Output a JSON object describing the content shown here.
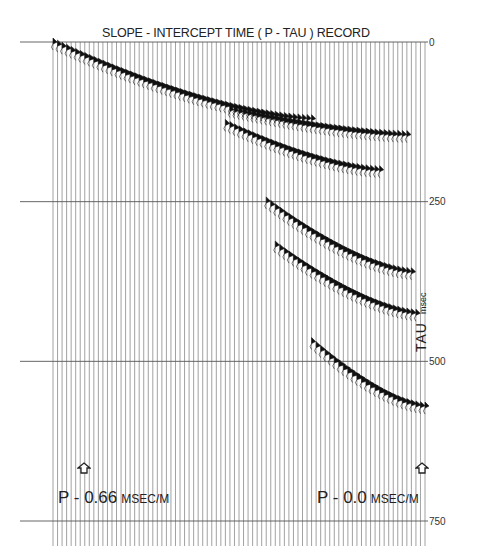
{
  "chart_data": {
    "type": "seismic-wiggle",
    "title": "SLOPE - INTERCEPT TIME ( P - TAU ) RECORD",
    "xlabel": "P (ray parameter)",
    "ylabel": "TAU",
    "ylabel_unit": "msec",
    "yticks": [
      0,
      250,
      500,
      750
    ],
    "ylim": [
      0,
      800
    ],
    "y_inverted": true,
    "trace_count": 83,
    "x_range_label": {
      "left": "P - 0.66 MSEC/M",
      "right": "P - 0.0 MSEC/M"
    },
    "events": [
      {
        "name": "event-1",
        "p_start": 0.66,
        "tau_start_ms": 0,
        "p_end": 0.2,
        "tau_end_ms": 120
      },
      {
        "name": "event-2",
        "p_start": 0.35,
        "tau_start_ms": 105,
        "p_end": 0.03,
        "tau_end_ms": 145
      },
      {
        "name": "event-3",
        "p_start": 0.36,
        "tau_start_ms": 125,
        "p_end": 0.08,
        "tau_end_ms": 200
      },
      {
        "name": "event-4",
        "p_start": 0.28,
        "tau_start_ms": 250,
        "p_end": 0.02,
        "tau_end_ms": 360
      },
      {
        "name": "event-5",
        "p_start": 0.27,
        "tau_start_ms": 315,
        "p_end": 0.01,
        "tau_end_ms": 425
      },
      {
        "name": "event-6",
        "p_start": 0.2,
        "tau_start_ms": 470,
        "p_end": 0.0,
        "tau_end_ms": 570
      }
    ],
    "grid": true
  },
  "labels": {
    "title": "SLOPE - INTERCEPT TIME ( P - TAU ) RECORD",
    "tick_0": "0",
    "tick_250": "250",
    "tick_500": "500",
    "tick_750": "750",
    "axis_main": "TAU",
    "axis_unit": "msec",
    "p_left_value": "P - 0.66",
    "p_left_unit": "MSEC/M",
    "p_right_value": "P - 0.0",
    "p_right_unit": "MSEC/M"
  },
  "colors": {
    "trace": "#8a8a8a",
    "event": "#111111",
    "timing_line": "#555555",
    "background": "#ffffff"
  }
}
